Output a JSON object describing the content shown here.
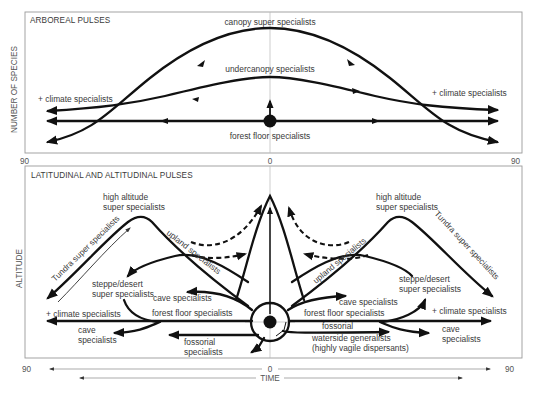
{
  "figure": {
    "top_panel": {
      "title": "ARBOREAL PULSES",
      "y_axis_label": "NUMBER OF SPECIES",
      "x_ticks": {
        "left": "90",
        "center": "0",
        "right": "90"
      },
      "labels": {
        "canopy": "canopy super specialists",
        "undercanopy": "undercanopy specialists",
        "climate_left": "+ climate specialists",
        "climate_right": "+ climate specialists",
        "forest_floor": "forest floor specialists"
      }
    },
    "bottom_panel": {
      "title": "LATITUDINAL AND ALTITUDINAL PULSES",
      "y_axis_label": "ALTITUDE",
      "labels": {
        "high_alt_left_1": "high altitude",
        "high_alt_left_2": "super specialists",
        "high_alt_right_1": "high altitude",
        "high_alt_right_2": "super specialists",
        "tundra_left": "Tundra super specialists",
        "tundra_right": "Tundra super specialists",
        "upland_left": "upland specialists",
        "upland_right": "upland specialists",
        "steppe_left_1": "steppe/desert",
        "steppe_left_2": "super specialists",
        "steppe_right_1": "steppe/desert",
        "steppe_right_2": "super specialists",
        "cave_left_upper": "cave specialists",
        "cave_right_upper": "cave specialists",
        "forest_floor_left": "forest floor specialists",
        "forest_floor_right": "forest floor specialists",
        "climate_left": "+ climate specialists",
        "climate_right": "+ climate specialists",
        "cave_left_lower_1": "cave",
        "cave_left_lower_2": "specialists",
        "cave_right_lower_1": "cave",
        "cave_right_lower_2": "specialists",
        "fossorial_left_1": "fossorial",
        "fossorial_left_2": "specialists",
        "fossorial_right": "fossorial",
        "waterside_1": "waterside generalists",
        "waterside_2": "(highly vagile dispersants)"
      }
    },
    "time_axis": {
      "left": "90",
      "center": "0",
      "right": "90",
      "label": "TIME"
    }
  }
}
